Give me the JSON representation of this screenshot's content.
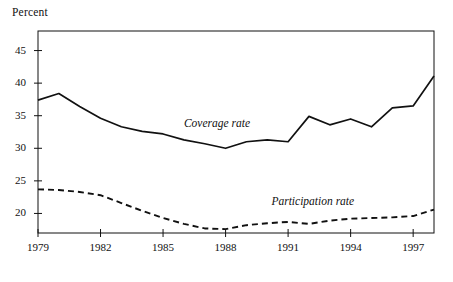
{
  "chart_data": {
    "type": "line",
    "title": "",
    "ylabel": "Percent",
    "xlabel": "",
    "ylim": [
      17,
      48
    ],
    "xlim": [
      1979,
      1998
    ],
    "grid": false,
    "legend_position": "inline-annotation",
    "yticks": [
      20,
      25,
      30,
      35,
      40,
      45
    ],
    "ytick_labels": [
      "20",
      "25",
      "30",
      "35",
      "40",
      "45"
    ],
    "xticks": [
      1979,
      1982,
      1985,
      1988,
      1991,
      1994,
      1997
    ],
    "xtick_labels": [
      "1979",
      "1982",
      "1985",
      "1988",
      "1991",
      "1994",
      "1997"
    ],
    "x": [
      1979,
      1980,
      1981,
      1982,
      1983,
      1984,
      1985,
      1986,
      1987,
      1988,
      1989,
      1990,
      1991,
      1992,
      1993,
      1994,
      1995,
      1996,
      1997,
      1998
    ],
    "series": [
      {
        "name": "Coverage rate",
        "style": "solid",
        "color": "#111111",
        "label_x": 1986.0,
        "label_y": 33.6,
        "values": [
          37.4,
          38.4,
          36.4,
          34.6,
          33.3,
          32.6,
          32.2,
          31.3,
          30.7,
          30.0,
          31.0,
          31.3,
          31.0,
          34.9,
          33.6,
          34.5,
          33.3,
          36.2,
          36.5,
          41.1
        ]
      },
      {
        "name": "Participation rate",
        "style": "dashed",
        "color": "#111111",
        "label_x": 1990.2,
        "label_y": 21.6,
        "values": [
          23.7,
          23.6,
          23.3,
          22.8,
          21.6,
          20.4,
          19.3,
          18.4,
          17.7,
          17.6,
          18.2,
          18.5,
          18.7,
          18.4,
          18.9,
          19.2,
          19.3,
          19.4,
          19.6,
          20.6
        ]
      }
    ]
  }
}
